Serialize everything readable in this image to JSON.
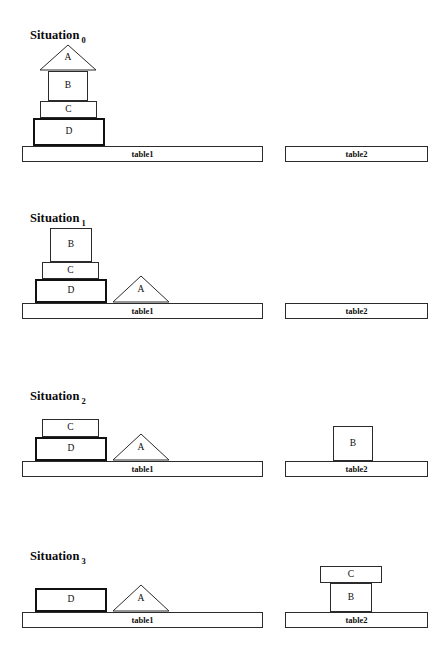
{
  "page": {
    "width": 447,
    "height": 662,
    "background": "#ffffff",
    "line_color": "#2b2b2b",
    "thick_line_color": "#111111",
    "fill_color": "#ffffff"
  },
  "labels": {
    "situation_word": "Situation",
    "table1": "table1",
    "table2": "table2",
    "block_a": "A",
    "block_b": "B",
    "block_c": "C",
    "block_d": "D"
  },
  "situations": [
    {
      "name": "situation-0",
      "caption": "Situation",
      "index": "0",
      "caption_x": 30,
      "caption_y": 28,
      "table1": {
        "label": "table1",
        "x": 22,
        "y": 146,
        "w": 241,
        "h": 16
      },
      "table2": {
        "label": "table2",
        "x": 285,
        "y": 146,
        "w": 143,
        "h": 16
      },
      "blocks": [
        {
          "id": "A",
          "shape": "triangle",
          "label": "A",
          "x": 39,
          "y": 44,
          "w": 58,
          "h": 27,
          "thick": false
        },
        {
          "id": "B",
          "shape": "rect",
          "label": "B",
          "x": 48,
          "y": 71,
          "w": 40,
          "h": 30,
          "thick": false
        },
        {
          "id": "C",
          "shape": "rect",
          "label": "C",
          "x": 40,
          "y": 101,
          "w": 57,
          "h": 17,
          "thick": false
        },
        {
          "id": "D",
          "shape": "rect",
          "label": "D",
          "x": 33,
          "y": 118,
          "w": 72,
          "h": 28,
          "thick": true
        }
      ]
    },
    {
      "name": "situation-1",
      "caption": "Situation",
      "index": "1",
      "caption_x": 30,
      "caption_y": 211,
      "table1": {
        "label": "table1",
        "x": 22,
        "y": 303,
        "w": 241,
        "h": 16
      },
      "table2": {
        "label": "table2",
        "x": 285,
        "y": 303,
        "w": 143,
        "h": 16
      },
      "blocks": [
        {
          "id": "B",
          "shape": "rect",
          "label": "B",
          "x": 50,
          "y": 228,
          "w": 42,
          "h": 34,
          "thick": false
        },
        {
          "id": "C",
          "shape": "rect",
          "label": "C",
          "x": 42,
          "y": 262,
          "w": 57,
          "h": 17,
          "thick": false
        },
        {
          "id": "D",
          "shape": "rect",
          "label": "D",
          "x": 35,
          "y": 279,
          "w": 72,
          "h": 24,
          "thick": true
        },
        {
          "id": "A",
          "shape": "triangle",
          "label": "A",
          "x": 112,
          "y": 275,
          "w": 58,
          "h": 28,
          "thick": false
        }
      ]
    },
    {
      "name": "situation-2",
      "caption": "Situation",
      "index": "2",
      "caption_x": 30,
      "caption_y": 389,
      "table1": {
        "label": "table1",
        "x": 22,
        "y": 461,
        "w": 241,
        "h": 16
      },
      "table2": {
        "label": "table2",
        "x": 285,
        "y": 461,
        "w": 143,
        "h": 16
      },
      "blocks": [
        {
          "id": "C",
          "shape": "rect",
          "label": "C",
          "x": 42,
          "y": 419,
          "w": 57,
          "h": 18,
          "thick": false
        },
        {
          "id": "D",
          "shape": "rect",
          "label": "D",
          "x": 35,
          "y": 437,
          "w": 72,
          "h": 24,
          "thick": true
        },
        {
          "id": "A",
          "shape": "triangle",
          "label": "A",
          "x": 112,
          "y": 433,
          "w": 58,
          "h": 28,
          "thick": false
        },
        {
          "id": "B",
          "shape": "rect",
          "label": "B",
          "x": 333,
          "y": 426,
          "w": 40,
          "h": 35,
          "thick": false
        }
      ]
    },
    {
      "name": "situation-3",
      "caption": "Situation",
      "index": "3",
      "caption_x": 30,
      "caption_y": 549,
      "table1": {
        "label": "table1",
        "x": 22,
        "y": 612,
        "w": 241,
        "h": 16
      },
      "table2": {
        "label": "table2",
        "x": 285,
        "y": 612,
        "w": 143,
        "h": 16
      },
      "blocks": [
        {
          "id": "D",
          "shape": "rect",
          "label": "D",
          "x": 35,
          "y": 588,
          "w": 72,
          "h": 24,
          "thick": true
        },
        {
          "id": "A",
          "shape": "triangle",
          "label": "A",
          "x": 112,
          "y": 584,
          "w": 58,
          "h": 28,
          "thick": false
        },
        {
          "id": "C",
          "shape": "rect",
          "label": "C",
          "x": 320,
          "y": 566,
          "w": 62,
          "h": 17,
          "thick": false
        },
        {
          "id": "B",
          "shape": "rect",
          "label": "B",
          "x": 330,
          "y": 583,
          "w": 42,
          "h": 29,
          "thick": false
        }
      ]
    }
  ]
}
